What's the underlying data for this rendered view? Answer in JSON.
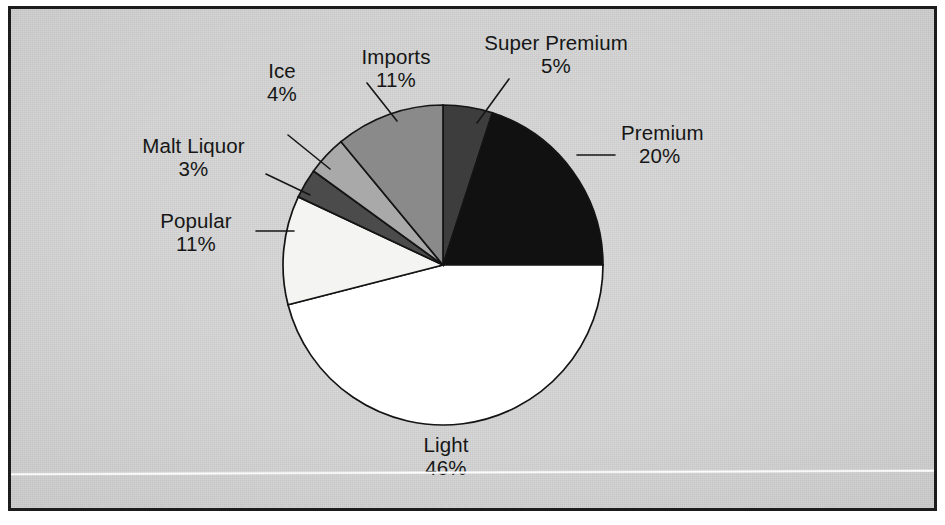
{
  "figure": {
    "background_color": "#d3d4d3",
    "frame_color": "#1c1c1c",
    "text_color": "#161616"
  },
  "chart_data": {
    "type": "pie",
    "title": "",
    "subtitle": "",
    "xlabel": "",
    "ylabel": "",
    "grid": false,
    "legend_position": "none",
    "label_format": "name + percent",
    "start_angle_deg": 0,
    "direction": "clockwise",
    "total_percent": 100,
    "categories": [
      "Super Premium",
      "Premium",
      "Light",
      "Popular",
      "Malt Liquor",
      "Ice",
      "Imports"
    ],
    "values": [
      5,
      20,
      46,
      11,
      3,
      4,
      11
    ],
    "slice_colors": [
      "#3d3d3d",
      "#111111",
      "#ffffff",
      "#f4f4f2",
      "#4b4b4b",
      "#a9a9a9",
      "#8a8a8a"
    ],
    "slices": [
      {
        "name": "Super Premium",
        "value": 5,
        "value_label": "5%",
        "color": "#3d3d3d"
      },
      {
        "name": "Premium",
        "value": 20,
        "value_label": "20%",
        "color": "#111111"
      },
      {
        "name": "Light",
        "value": 46,
        "value_label": "46%",
        "color": "#ffffff"
      },
      {
        "name": "Popular",
        "value": 11,
        "value_label": "11%",
        "color": "#f4f4f2"
      },
      {
        "name": "Malt Liquor",
        "value": 3,
        "value_label": "3%",
        "color": "#4b4b4b"
      },
      {
        "name": "Ice",
        "value": 4,
        "value_label": "4%",
        "color": "#a9a9a9"
      },
      {
        "name": "Imports",
        "value": 11,
        "value_label": "11%",
        "color": "#8a8a8a"
      }
    ]
  },
  "labels": {
    "super_premium": {
      "name": "Super Premium",
      "value": "5%"
    },
    "premium": {
      "name": "Premium",
      "value": "20%"
    },
    "light": {
      "name": "Light",
      "value": "46%"
    },
    "popular": {
      "name": "Popular",
      "value": "11%"
    },
    "malt_liquor": {
      "name": "Malt Liquor",
      "value": "3%"
    },
    "ice": {
      "name": "Ice",
      "value": "4%"
    },
    "imports": {
      "name": "Imports",
      "value": "11%"
    }
  }
}
